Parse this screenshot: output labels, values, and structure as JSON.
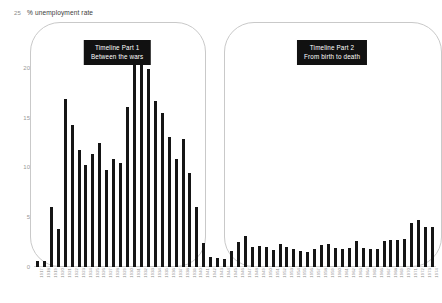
{
  "axis": {
    "top_tick": "25",
    "title": "% unemployment rate",
    "y_ticks": [
      "0",
      "5",
      "10",
      "15",
      "20",
      "25"
    ]
  },
  "callouts": [
    {
      "line1": "Timeline Part 1",
      "line2": "Between the wars"
    },
    {
      "line1": "Timeline Part 2",
      "line2": "From birth to death"
    }
  ],
  "chart_data": {
    "type": "bar",
    "title": "% unemployment rate",
    "xlabel": "",
    "ylabel": "% unemployment rate",
    "ylim": [
      0,
      25
    ],
    "yticks": [
      0,
      5,
      10,
      15,
      20,
      25
    ],
    "grid": false,
    "legend": false,
    "bar_color": "#151515",
    "categories": [
      "1917",
      "1918",
      "1919",
      "1920",
      "1921",
      "1922",
      "1923",
      "1924",
      "1925",
      "1926",
      "1927",
      "1928",
      "1929",
      "1930",
      "1931",
      "1932",
      "1933",
      "1934",
      "1935",
      "1936",
      "1937",
      "1938",
      "1939",
      "1940",
      "1941",
      "1942",
      "1943",
      "1944",
      "1945",
      "1946",
      "1947",
      "1948",
      "1949",
      "1950",
      "1951",
      "1952",
      "1953",
      "1954",
      "1955",
      "1956",
      "1957",
      "1958",
      "1959",
      "1960",
      "1961",
      "1962",
      "1963",
      "1964",
      "1965",
      "1966",
      "1967",
      "1968",
      "1969",
      "1970",
      "1971",
      "1972",
      "1973",
      "1974"
    ],
    "values": [
      0.6,
      0.6,
      6.0,
      3.8,
      16.9,
      14.3,
      11.7,
      10.2,
      11.3,
      12.5,
      9.7,
      10.8,
      10.4,
      16.1,
      21.3,
      22.5,
      19.9,
      16.7,
      15.5,
      13.1,
      10.8,
      12.9,
      9.4,
      6.0,
      2.4,
      1.0,
      0.9,
      0.8,
      1.6,
      2.5,
      3.1,
      2.0,
      2.1,
      2.0,
      1.7,
      2.3,
      2.0,
      1.8,
      1.6,
      1.5,
      1.8,
      2.2,
      2.3,
      1.9,
      1.8,
      1.9,
      2.6,
      1.9,
      1.8,
      1.8,
      2.6,
      2.7,
      2.7,
      2.8,
      4.4,
      4.7,
      4.0,
      4.0
    ],
    "annotations": [
      {
        "text": "Timeline Part 1 / Between the wars",
        "span": [
          "1917",
          "1940"
        ]
      },
      {
        "text": "Timeline Part 2 / From birth to death",
        "span": [
          "1945",
          "1974"
        ]
      }
    ]
  }
}
